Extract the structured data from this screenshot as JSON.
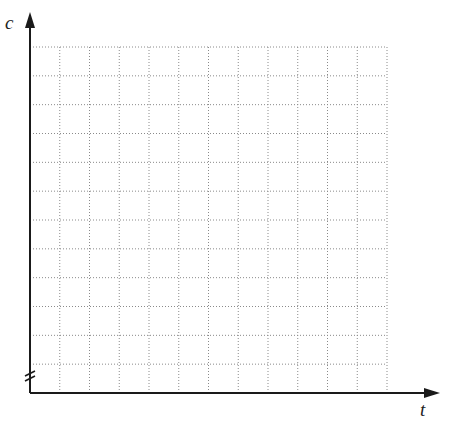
{
  "chart_data": {
    "type": "line",
    "title": "",
    "xlabel": "t",
    "ylabel": "c",
    "series": [],
    "grid": {
      "on": true,
      "style": "dotted",
      "columns": 12,
      "rows": 12
    },
    "axis_break": "y-axis near origin",
    "tick_labels": {
      "x": [],
      "y": []
    },
    "legend": null
  },
  "colors": {
    "axis": "#1a1a1a",
    "grid": "#8a8a8a",
    "background": "#ffffff"
  }
}
